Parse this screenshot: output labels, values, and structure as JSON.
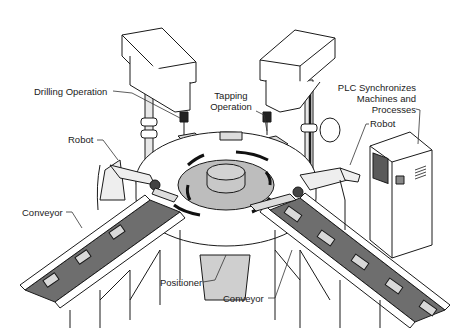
{
  "diagram": {
    "labels": {
      "drilling": "Drilling Operation",
      "tapping_line1": "Tapping",
      "tapping_line2": "Operation",
      "plc_line1": "PLC Synchronizes",
      "plc_line2": "Machines and",
      "plc_line3": "Processes",
      "robot_left": "Robot",
      "robot_right": "Robot",
      "conveyor_left": "Conveyor",
      "conveyor_right": "Conveyor",
      "positioner": "Positioner"
    },
    "colors": {
      "line": "#1a1a1a",
      "belt": "#6e6e6e",
      "table_center": "#bdbdbd",
      "part": "#d9d9d9",
      "screen": "#5a5a5a",
      "background": "#ffffff"
    }
  }
}
